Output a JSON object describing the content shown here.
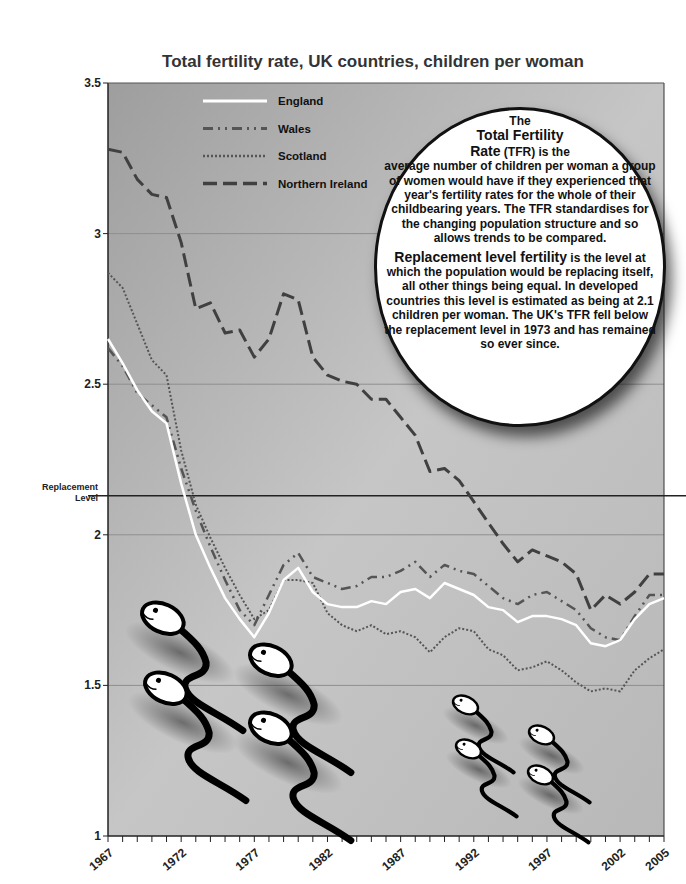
{
  "chart_data": {
    "type": "line",
    "title": "Total fertility rate, UK countries, children per woman",
    "xlabel": "",
    "ylabel": "",
    "ylim": [
      1,
      3.5
    ],
    "xlim": [
      1967,
      2005
    ],
    "grid": true,
    "legend_position": "top-left (inside plot)",
    "x": [
      1967,
      1968,
      1969,
      1970,
      1971,
      1972,
      1973,
      1974,
      1975,
      1976,
      1977,
      1978,
      1979,
      1980,
      1981,
      1982,
      1983,
      1984,
      1985,
      1986,
      1987,
      1988,
      1989,
      1990,
      1991,
      1992,
      1993,
      1994,
      1995,
      1996,
      1997,
      1998,
      1999,
      2000,
      2001,
      2002,
      2003,
      2004,
      2005
    ],
    "x_tick_labels": [
      "1967",
      "1972",
      "1977",
      "1982",
      "1987",
      "1992",
      "1997",
      "2002",
      "2005"
    ],
    "y_tick_labels": [
      "1",
      "1.5",
      "2",
      "2.5",
      "3",
      "3.5"
    ],
    "series": [
      {
        "name": "England",
        "style": "solid-white",
        "values": [
          2.65,
          2.57,
          2.48,
          2.41,
          2.37,
          2.17,
          2.0,
          1.89,
          1.79,
          1.72,
          1.66,
          1.74,
          1.85,
          1.89,
          1.81,
          1.77,
          1.76,
          1.76,
          1.78,
          1.77,
          1.81,
          1.82,
          1.79,
          1.84,
          1.82,
          1.8,
          1.76,
          1.75,
          1.71,
          1.73,
          1.73,
          1.72,
          1.7,
          1.64,
          1.63,
          1.65,
          1.72,
          1.77,
          1.79
        ]
      },
      {
        "name": "Wales",
        "style": "dash-dot",
        "values": [
          2.62,
          2.56,
          2.47,
          2.43,
          2.39,
          2.22,
          2.08,
          1.96,
          1.85,
          1.75,
          1.7,
          1.8,
          1.9,
          1.94,
          1.86,
          1.84,
          1.82,
          1.83,
          1.86,
          1.86,
          1.88,
          1.91,
          1.86,
          1.9,
          1.88,
          1.87,
          1.83,
          1.79,
          1.77,
          1.8,
          1.81,
          1.78,
          1.75,
          1.69,
          1.66,
          1.65,
          1.73,
          1.8,
          1.8
        ]
      },
      {
        "name": "Scotland",
        "style": "dotted",
        "values": [
          2.87,
          2.82,
          2.7,
          2.58,
          2.53,
          2.28,
          2.1,
          1.99,
          1.89,
          1.8,
          1.72,
          1.75,
          1.85,
          1.85,
          1.84,
          1.74,
          1.7,
          1.68,
          1.7,
          1.67,
          1.68,
          1.66,
          1.61,
          1.66,
          1.69,
          1.68,
          1.62,
          1.6,
          1.55,
          1.56,
          1.58,
          1.55,
          1.51,
          1.48,
          1.49,
          1.48,
          1.55,
          1.59,
          1.62
        ]
      },
      {
        "name": "Northern Ireland",
        "style": "long-dash",
        "values": [
          3.28,
          3.27,
          3.18,
          3.13,
          3.12,
          2.97,
          2.75,
          2.77,
          2.67,
          2.68,
          2.59,
          2.65,
          2.8,
          2.78,
          2.59,
          2.53,
          2.51,
          2.5,
          2.45,
          2.45,
          2.39,
          2.33,
          2.21,
          2.22,
          2.18,
          2.11,
          2.04,
          1.97,
          1.91,
          1.95,
          1.93,
          1.91,
          1.87,
          1.75,
          1.8,
          1.77,
          1.81,
          1.87,
          1.87
        ]
      }
    ],
    "reference_lines": [
      {
        "label": "Replacement Level",
        "value": 2.13
      }
    ],
    "annotations": [
      "The Total Fertility Rate (TFR) is the average number of children per woman a group of women would have if they experienced that year's fertility rates for the whole of their childbearing years. The TFR standardises for the changing population structure and so allows trends to be compared.",
      "Replacement level fertility is the level at which the population would be replacing itself, all other things being equal. In developed countries this level is estimated as being at 2.1 children per woman. The UK's TFR fell below the replacement level in 1973 and has remained so ever since."
    ]
  },
  "title": "Total fertility rate, UK countries, children per woman",
  "legend": [
    {
      "label": "England"
    },
    {
      "label": "Wales"
    },
    {
      "label": "Scotland"
    },
    {
      "label": "Northern Ireland"
    }
  ],
  "reference": {
    "line1": "Replacement",
    "line2": "Level"
  },
  "bubble": {
    "p1_the": "The",
    "p1_heading": "Total Fertility",
    "p1_rate": "Rate",
    "p1_tfr": "(TFR)",
    "p1_is": " is the",
    "p1_body": "average number of children per woman a group of women would have if they experienced that year's fertility rates for the whole of their childbearing years. The TFR standardises for the changing population structure and so allows trends to be compared.",
    "p2_heading": "Replacement level fertility",
    "p2_body": " is the level at which the population would be replacing itself, all other things being equal. In developed countries this level is estimated as being at 2.1 children per woman. The UK's TFR fell below the replacement level in 1973 and has remained so ever since."
  },
  "colors": {
    "plot_bg_top": "#a9a9a9",
    "plot_bg_bottom": "#c4c4c4",
    "england": "#ffffff",
    "wales": "#555555",
    "scotland": "#555555",
    "northern_ireland": "#404040",
    "axis": "#222222"
  }
}
